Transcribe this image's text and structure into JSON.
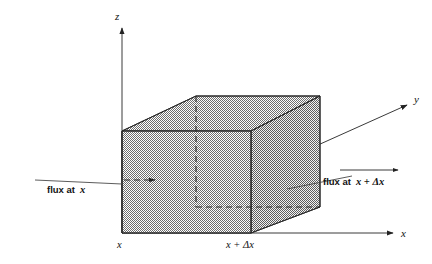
{
  "figure": {
    "background_color": "#ffffff",
    "shading_color": "#9a9a9a",
    "line_color": "#2b2b2b"
  },
  "axes": {
    "z": {
      "label": "z",
      "name": "z-axis"
    },
    "y": {
      "label": "y",
      "name": "y-axis"
    },
    "x": {
      "label": "x",
      "name": "x-axis"
    }
  },
  "ticks": {
    "origin": {
      "label": "x"
    },
    "far": {
      "label": "x + Δx"
    }
  },
  "annotations": {
    "flux_in": {
      "text_prefix": "flux at",
      "text_var": "x",
      "full": "flux at x"
    },
    "flux_out": {
      "text_prefix": "flux at",
      "text_var": "x + Δx",
      "full": "flux at x + Δx"
    }
  },
  "geometry": {
    "front_face": "122,131 251,131 251,233 122,233",
    "top_face": "122,131 196,96 320,96 251,131",
    "right_face": "251,131 320,96 320,207 251,233",
    "origin_point": [
      122,
      233
    ],
    "z_axis": {
      "from": [
        122,
        233
      ],
      "to": [
        122,
        26
      ]
    },
    "x_axis": {
      "from": [
        122,
        233
      ],
      "to": [
        395,
        233
      ]
    },
    "y_axis": {
      "from": [
        122,
        233
      ],
      "to": [
        409,
        104
      ]
    },
    "hidden_vertical": {
      "from": [
        196,
        96
      ],
      "to": [
        196,
        207
      ]
    },
    "hidden_bottom_back": {
      "from": [
        196,
        207
      ],
      "to": [
        320,
        207
      ]
    },
    "interior_arrow": {
      "from": [
        124,
        180
      ],
      "to": [
        162,
        180
      ]
    }
  }
}
